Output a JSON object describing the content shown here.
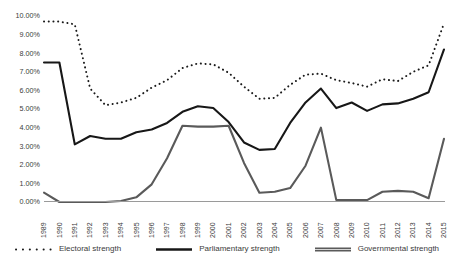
{
  "chart_data": {
    "type": "line",
    "title": "",
    "xlabel": "",
    "ylabel": "",
    "ylim": [
      0,
      10
    ],
    "ytick_format": "percent",
    "grid": false,
    "legend_position": "bottom",
    "categories": [
      "1989",
      "1990",
      "1991",
      "1992",
      "1993",
      "1994",
      "1995",
      "1996",
      "1997",
      "1998",
      "1999",
      "2000",
      "2001",
      "2002",
      "2003",
      "2004",
      "2005",
      "2006",
      "2007",
      "2008",
      "2009",
      "2010",
      "2011",
      "2012",
      "2013",
      "2014",
      "2015"
    ],
    "ytick_labels": [
      "0.00%",
      "1.00%",
      "2.00%",
      "3.00%",
      "4.00%",
      "5.00%",
      "6.00%",
      "7.00%",
      "8.00%",
      "9.00%",
      "10.00%"
    ],
    "ytick_values": [
      0,
      1,
      2,
      3,
      4,
      5,
      6,
      7,
      8,
      9,
      10
    ],
    "series": [
      {
        "name": "Electoral strength",
        "style": "dotted",
        "color": "#1a1a1a",
        "values": [
          9.7,
          9.7,
          9.55,
          6.1,
          5.2,
          5.35,
          5.6,
          6.15,
          6.55,
          7.2,
          7.45,
          7.4,
          6.95,
          6.2,
          5.55,
          5.6,
          6.3,
          6.85,
          6.9,
          6.55,
          6.4,
          6.2,
          6.6,
          6.5,
          7.0,
          7.35,
          9.6
        ]
      },
      {
        "name": "Parliamentary strength",
        "style": "solid",
        "color": "#171717",
        "values": [
          7.5,
          7.5,
          3.1,
          3.55,
          3.4,
          3.4,
          3.75,
          3.9,
          4.25,
          4.85,
          5.15,
          5.05,
          4.3,
          3.2,
          2.8,
          2.85,
          4.25,
          5.35,
          6.1,
          5.05,
          5.35,
          4.9,
          5.25,
          5.3,
          5.55,
          5.9,
          8.2
        ]
      },
      {
        "name": "Governmental strength",
        "style": "solid-gray",
        "color": "#5a5a5a",
        "values": [
          0.5,
          0.0,
          0.0,
          0.0,
          0.0,
          0.05,
          0.25,
          0.95,
          2.35,
          4.1,
          4.05,
          4.05,
          4.1,
          2.1,
          0.5,
          0.55,
          0.75,
          1.95,
          4.0,
          0.1,
          0.1,
          0.1,
          0.55,
          0.6,
          0.55,
          0.2,
          3.4
        ]
      }
    ]
  },
  "legend": {
    "items": [
      {
        "label": "Electoral strength"
      },
      {
        "label": "Parliamentary strength"
      },
      {
        "label": "Governmental strength"
      }
    ]
  }
}
